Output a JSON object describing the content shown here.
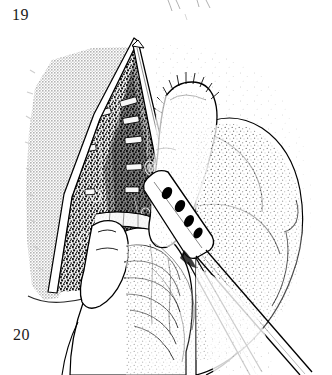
{
  "figure": {
    "kind": "surgical-line-art-illustration",
    "technique": "stippled pen-and-ink with halftone screen",
    "width": 332,
    "height": 375,
    "background_color": "#ffffff",
    "ink_color": "#000000",
    "label_color": "#1a1a1a",
    "halftone_gray": "#c8c8c8",
    "stipple_gray": "#3a3a3a"
  },
  "labels": {
    "top_left": "19",
    "bottom_left": "20"
  },
  "partial_figure_above": {
    "description": "faint cut-off ink strokes from the preceding figure",
    "strokes": [
      {
        "x1": 168,
        "y1": 0,
        "x2": 172,
        "y2": 10
      },
      {
        "x1": 176,
        "y1": 0,
        "x2": 180,
        "y2": 9
      },
      {
        "x1": 196,
        "y1": 0,
        "x2": 199,
        "y2": 7
      },
      {
        "x1": 206,
        "y1": 0,
        "x2": 210,
        "y2": 8
      },
      {
        "x1": 184,
        "y1": 14,
        "x2": 187,
        "y2": 20
      }
    ]
  },
  "scene": {
    "description": "Operative field: a V-shaped surgical opening retracted to expose deep stippled tissue with pale cartilage rings; a gloved hand at lower left steadies the field with the thumb while a second hand at right introduces a fenestrated instrument through the wound; a draped gray field covers the left portion.",
    "elements": [
      {
        "name": "drape-field",
        "role": "halftone gray drape covering left side of operative field"
      },
      {
        "name": "wound-opening",
        "role": "V-shaped retracted incision with apex near the top"
      },
      {
        "name": "wound-wall-left",
        "role": "left cut edge of the wound, white highlight band"
      },
      {
        "name": "wound-wall-right",
        "role": "right cut edge of the wound, white highlight band"
      },
      {
        "name": "deep-tissue",
        "role": "dark stippled tissue filling the wound cavity"
      },
      {
        "name": "cartilage-rings",
        "role": "pale rung-shaped cartilage rings descending in the cavity"
      },
      {
        "name": "thumb",
        "role": "surgeon thumb entering from lower left pressing tissue"
      },
      {
        "name": "hand-lower-left",
        "role": "hand with palm creases at bottom center-left"
      },
      {
        "name": "hand-right",
        "role": "stippled hand at right gripping the instrument"
      },
      {
        "name": "index-finger",
        "role": "index finger of the right hand, hair strokes along its dorsum"
      },
      {
        "name": "fenestrated-instrument",
        "role": "perforated blade with four dark oval fenestrations"
      },
      {
        "name": "instrument-shaft",
        "role": "long paired shaft running off the lower right corner"
      },
      {
        "name": "tube-structure",
        "role": "pale tubular structure crossing the lower wound"
      }
    ]
  },
  "geometry": {
    "wound_apex": {
      "x": 138,
      "y": 40
    },
    "wound_base_left": {
      "x": 52,
      "y": 296
    },
    "wound_base_right": {
      "x": 186,
      "y": 250
    },
    "drape_bounds": {
      "x": 25,
      "y": 45,
      "width": 110,
      "height": 255
    },
    "instrument_head": {
      "x": 152,
      "y": 175
    },
    "instrument_tip": {
      "x": 300,
      "y": 375
    },
    "fenestrations": [
      {
        "cx": 167,
        "cy": 193,
        "rx": 4.5,
        "ry": 6.5,
        "angle": 32
      },
      {
        "cx": 180,
        "cy": 205,
        "rx": 4.5,
        "ry": 6.5,
        "angle": 32
      },
      {
        "cx": 188,
        "cy": 221,
        "rx": 4.5,
        "ry": 6.5,
        "angle": 32
      },
      {
        "cx": 197,
        "cy": 232,
        "rx": 4.0,
        "ry": 6.0,
        "angle": 32
      }
    ],
    "cartilage_rings": [
      {
        "x": 120,
        "y": 102,
        "w": 16,
        "h": 6,
        "angle": -16
      },
      {
        "x": 124,
        "y": 120,
        "w": 15,
        "h": 6,
        "angle": -10
      },
      {
        "x": 126,
        "y": 140,
        "w": 16,
        "h": 6,
        "angle": -6
      },
      {
        "x": 127,
        "y": 167,
        "w": 15,
        "h": 6,
        "angle": -3
      },
      {
        "x": 126,
        "y": 190,
        "w": 13,
        "h": 5,
        "angle": 0
      },
      {
        "x": 100,
        "y": 112,
        "w": 12,
        "h": 6,
        "angle": -14
      },
      {
        "x": 86,
        "y": 148,
        "w": 11,
        "h": 6,
        "angle": -8
      },
      {
        "x": 86,
        "y": 192,
        "w": 10,
        "h": 6,
        "angle": -4
      }
    ]
  }
}
